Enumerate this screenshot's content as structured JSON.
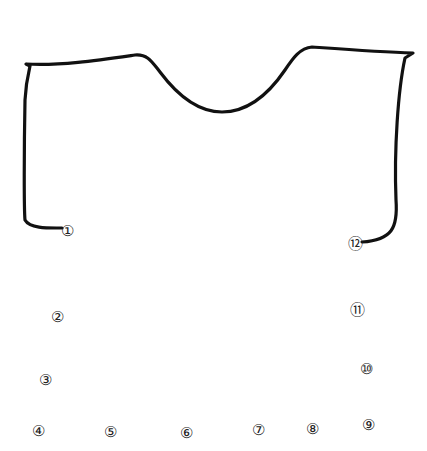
{
  "diagram": {
    "type": "pattern-outline",
    "stroke_color": "#111111",
    "background": "#ffffff",
    "outline_path": "M 62 228 C 50 228, 30 229, 25 220 C 24 210, 24 150, 25 100 C 26 80, 30 67, 30 66 L 26 64 C 60 66, 100 60, 135 55 C 148 54, 152 62, 160 72 C 175 92, 195 112, 222 112 C 248 112, 268 95, 285 70 C 293 58, 300 48, 312 47 C 340 49, 380 52, 413 53 L 405 58 C 398 90, 394 150, 396 200 C 398 228, 392 240, 362 242",
    "labels": [
      {
        "id": "1",
        "text": "①",
        "x": 67,
        "y": 231
      },
      {
        "id": "2",
        "text": "②",
        "x": 57,
        "y": 317
      },
      {
        "id": "3",
        "text": "③",
        "x": 45,
        "y": 380
      },
      {
        "id": "4",
        "text": "④",
        "x": 38,
        "y": 431
      },
      {
        "id": "5",
        "text": "⑤",
        "x": 110,
        "y": 432
      },
      {
        "id": "6",
        "text": "⑥",
        "x": 186,
        "y": 433
      },
      {
        "id": "7",
        "text": "⑦",
        "x": 258,
        "y": 430
      },
      {
        "id": "8",
        "text": "⑧",
        "x": 312,
        "y": 429
      },
      {
        "id": "9",
        "text": "⑨",
        "x": 368,
        "y": 425
      },
      {
        "id": "10",
        "text": "⑩",
        "x": 366,
        "y": 369
      },
      {
        "id": "11",
        "text": "⑪",
        "x": 357,
        "y": 310
      },
      {
        "id": "12",
        "text": "⑫",
        "x": 355,
        "y": 244
      }
    ]
  }
}
